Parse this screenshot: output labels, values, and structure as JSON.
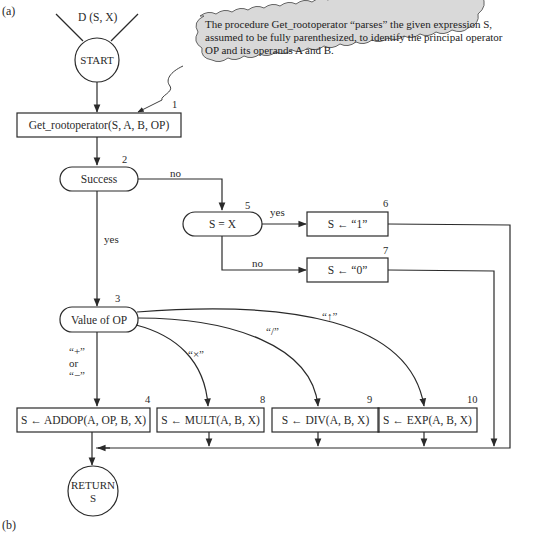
{
  "figure": {
    "panel_a_label": "(a)",
    "panel_b_label": "(b)"
  },
  "start": {
    "input_label": "D (S, X)",
    "label": "START"
  },
  "note": {
    "text": "The procedure Get_rootoperator “parses” the given expression S, assumed to be fully parenthesized, to identify the principal operator OP and its operands A and B."
  },
  "nodes": {
    "n1": {
      "number": "1",
      "label": "Get_rootoperator(S, A, B, OP)"
    },
    "n2": {
      "number": "2",
      "label": "Success"
    },
    "n3": {
      "number": "3",
      "label": "Value of OP"
    },
    "n4": {
      "number": "4",
      "label": "S ← ADDOP(A, OP, B, X)"
    },
    "n5": {
      "number": "5",
      "label": "S = X"
    },
    "n6": {
      "number": "6",
      "label": "S ← “1”"
    },
    "n7": {
      "number": "7",
      "label": "S ← “0”"
    },
    "n8": {
      "number": "8",
      "label": "S ← MULT(A, B, X)"
    },
    "n9": {
      "number": "9",
      "label": "S ← DIV(A, B, X)"
    },
    "n10": {
      "number": "10",
      "label": "S ← EXP(A, B, X)"
    }
  },
  "edges": {
    "success_no": "no",
    "success_yes": "yes",
    "eq_yes": "yes",
    "eq_no": "no",
    "op_plus_line1": "“+”",
    "op_plus_line2": "or",
    "op_plus_line3": "“−”",
    "op_times": "“×”",
    "op_div": "“/”",
    "op_exp": "“↑”"
  },
  "end": {
    "line1": "RETURN",
    "line2": "S"
  }
}
